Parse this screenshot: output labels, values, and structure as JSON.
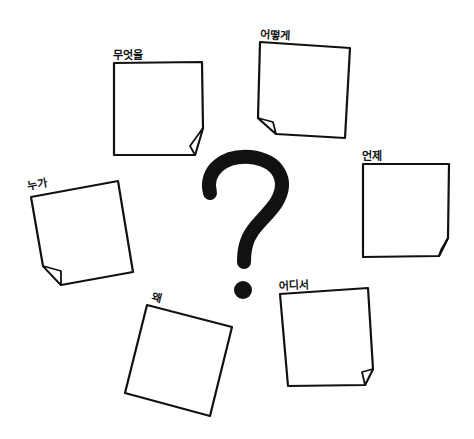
{
  "diagram": {
    "type": "5W1H brainstorming sticky notes",
    "center_symbol": "?",
    "colors": {
      "ink": "#111111",
      "paper": "#ffffff",
      "background": "#ffffff"
    },
    "notes": [
      {
        "id": "what",
        "label": "무엇을",
        "label_pos": [
          113,
          50
        ],
        "rotate": 0,
        "points": [
          [
            114,
            63
          ],
          [
            202,
            62
          ],
          [
            203,
            128
          ],
          [
            195,
            155
          ],
          [
            114,
            155
          ]
        ],
        "curl": [
          [
            203,
            128
          ],
          [
            190,
            146
          ],
          [
            195,
            155
          ]
        ]
      },
      {
        "id": "how",
        "label": "어떻게",
        "label_pos": [
          260,
          29
        ],
        "rotate": 3,
        "points": [
          [
            260,
            42
          ],
          [
            350,
            48
          ],
          [
            345,
            138
          ],
          [
            276,
            134
          ],
          [
            258,
            118
          ]
        ],
        "curl": [
          [
            258,
            118
          ],
          [
            273,
            122
          ],
          [
            276,
            134
          ]
        ]
      },
      {
        "id": "who",
        "label": "누가",
        "label_pos": [
          28,
          181
        ],
        "rotate": -10,
        "points": [
          [
            31,
            197
          ],
          [
            118,
            181
          ],
          [
            133,
            272
          ],
          [
            61,
            285
          ],
          [
            43,
            266
          ]
        ],
        "curl": [
          [
            43,
            266
          ],
          [
            61,
            271
          ],
          [
            61,
            285
          ]
        ]
      },
      {
        "id": "when",
        "label": "언제",
        "label_pos": [
          362,
          151
        ],
        "rotate": 0,
        "points": [
          [
            363,
            164
          ],
          [
            449,
            164
          ],
          [
            448,
            238
          ],
          [
            439,
            256
          ],
          [
            363,
            257
          ]
        ],
        "curl": [
          [
            448,
            238
          ],
          [
            441,
            250
          ],
          [
            439,
            256
          ]
        ]
      },
      {
        "id": "why",
        "label": "왜",
        "label_pos": [
          150,
          291
        ],
        "rotate": 15,
        "points": [
          [
            147,
            305
          ],
          [
            232,
            327
          ],
          [
            210,
            416
          ],
          [
            125,
            393
          ]
        ],
        "curl": []
      },
      {
        "id": "where",
        "label": "어디서",
        "label_pos": [
          279,
          281
        ],
        "rotate": -3,
        "points": [
          [
            280,
            294
          ],
          [
            368,
            288
          ],
          [
            373,
            369
          ],
          [
            365,
            385
          ],
          [
            288,
            386
          ]
        ],
        "curl": [
          [
            373,
            369
          ],
          [
            362,
            372
          ],
          [
            365,
            385
          ]
        ]
      }
    ]
  }
}
